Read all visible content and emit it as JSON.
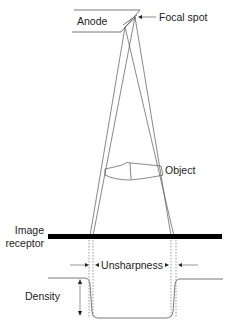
{
  "diagram": {
    "type": "radiographic geometric unsharpness",
    "labels": {
      "anode": "Anode",
      "focal_spot": "Focal spot",
      "object": "Object",
      "image_receptor_line1": "Image",
      "image_receptor_line2": "receptor",
      "unsharpness": "Unsharpness",
      "density": "Density"
    },
    "colors": {
      "line": "#555555",
      "receptor": "#000000",
      "text": "#222222"
    }
  }
}
